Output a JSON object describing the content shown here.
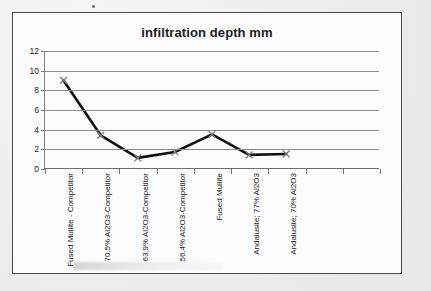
{
  "chart_data": {
    "type": "line",
    "title": "infiltration depth mm",
    "xlabel": "",
    "ylabel": "",
    "ylim": [
      0,
      12
    ],
    "ytick_step": 2,
    "yticks": [
      "0",
      "2",
      "4",
      "6",
      "8",
      "10",
      "12"
    ],
    "grid": true,
    "legend": "none",
    "marker": "x",
    "line_color": "#121212",
    "marker_color": "#7d7d7d",
    "categories": [
      "Fused Mullite - Competitor",
      "70.5% Al2O3-Competitor",
      "63.9% Al2O3-Competitor",
      "56.4% Al2O3-Competitor",
      "Fused Mullite",
      "Andalusite; 77% Al2O3",
      "Andalusite; 70% Al2O3"
    ],
    "values": [
      9.0,
      3.4,
      1.1,
      1.7,
      3.5,
      1.4,
      1.5
    ],
    "series": [
      {
        "name": "infiltration depth mm",
        "values": [
          9.0,
          3.4,
          1.1,
          1.7,
          3.5,
          1.4,
          1.5
        ]
      }
    ]
  },
  "figure": {
    "background_color": "#efefef",
    "plot_background_color": "#fcfcfc",
    "frame_color": "#4a4a4a",
    "gridline_color": "#8c8c8c"
  }
}
